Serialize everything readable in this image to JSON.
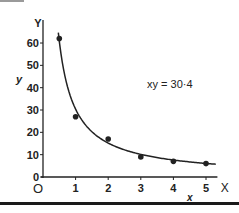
{
  "chart_data": {
    "type": "scatter",
    "title": "",
    "annotation": "xy = 30·4",
    "xlabel": "x",
    "ylabel": "y",
    "x_axis_end_label": "X",
    "y_axis_end_label": "Y",
    "origin_label": "O",
    "xlim": [
      0,
      5.4
    ],
    "ylim": [
      0,
      65
    ],
    "xticks": [
      "1",
      "2",
      "3",
      "4",
      "5"
    ],
    "yticks": [
      "0",
      "10",
      "20",
      "30",
      "40",
      "50",
      "60"
    ],
    "grid": false,
    "legend": null,
    "series": [
      {
        "name": "measured points",
        "type": "scatter",
        "x": [
          0.5,
          1,
          2,
          3,
          4,
          5
        ],
        "y": [
          62,
          27,
          17,
          9,
          7,
          6
        ]
      },
      {
        "name": "fitted curve xy = 30.4",
        "type": "line",
        "function": "y = 30.4 / x",
        "x_range": [
          0.47,
          5.3
        ]
      }
    ]
  },
  "colors": {
    "ink": "#222222",
    "background": "#ffffff"
  }
}
